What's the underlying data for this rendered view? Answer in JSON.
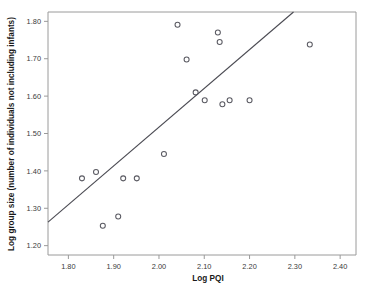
{
  "chart_data": {
    "type": "scatter",
    "title": "",
    "xlabel": "Log PQI",
    "ylabel": "Log group size  (number of individuals not including infants)",
    "xlim": [
      1.755,
      2.435
    ],
    "ylim": [
      1.175,
      1.825
    ],
    "xticks": [
      "1.80",
      "1.90",
      "2.00",
      "2.10",
      "2.20",
      "2.30",
      "2.40"
    ],
    "xtick_values": [
      1.8,
      1.9,
      2.0,
      2.1,
      2.2,
      2.3,
      2.4
    ],
    "yticks": [
      "1.20",
      "1.30",
      "1.40",
      "1.50",
      "1.60",
      "1.70",
      "1.80"
    ],
    "ytick_values": [
      1.2,
      1.3,
      1.4,
      1.5,
      1.6,
      1.7,
      1.8
    ],
    "grid": false,
    "legend": null,
    "marker_style": "open-circle",
    "points": [
      {
        "x": 1.83,
        "y": 1.38
      },
      {
        "x": 1.861,
        "y": 1.397
      },
      {
        "x": 1.876,
        "y": 1.253
      },
      {
        "x": 1.91,
        "y": 1.278
      },
      {
        "x": 1.921,
        "y": 1.38
      },
      {
        "x": 1.951,
        "y": 1.38
      },
      {
        "x": 2.011,
        "y": 1.445
      },
      {
        "x": 2.041,
        "y": 1.791
      },
      {
        "x": 2.061,
        "y": 1.698
      },
      {
        "x": 2.081,
        "y": 1.61
      },
      {
        "x": 2.101,
        "y": 1.589
      },
      {
        "x": 2.13,
        "y": 1.77
      },
      {
        "x": 2.134,
        "y": 1.745
      },
      {
        "x": 2.14,
        "y": 1.578
      },
      {
        "x": 2.156,
        "y": 1.589
      },
      {
        "x": 2.2,
        "y": 1.589
      },
      {
        "x": 2.333,
        "y": 1.738
      }
    ],
    "fit_line": {
      "type": "linear-regression",
      "x_start": 1.755,
      "y_start": 1.263,
      "x_end": 2.297,
      "y_end": 1.825
    }
  }
}
